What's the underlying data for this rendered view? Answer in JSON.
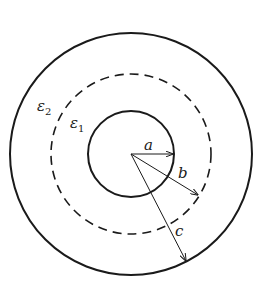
{
  "diagram": {
    "title": "",
    "center": {
      "x": 131,
      "y": 154
    },
    "circles": [
      {
        "id": "inner",
        "radius": 43,
        "style": "solid",
        "stroke_width": 2
      },
      {
        "id": "middle",
        "radius": 80,
        "style": "dashed",
        "stroke_width": 1.6
      },
      {
        "id": "outer",
        "radius": 121,
        "style": "solid",
        "stroke_width": 2
      }
    ],
    "labels": {
      "eps2": {
        "base": "ε",
        "sub": "2"
      },
      "eps1": {
        "base": "ε",
        "sub": "1"
      },
      "a": "a",
      "b": "b",
      "c": "c"
    },
    "colors": {
      "stroke": "#1a1a1a",
      "background": "#ffffff"
    }
  }
}
